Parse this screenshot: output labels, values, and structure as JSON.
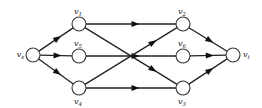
{
  "diagram": {
    "type": "directed-network",
    "nodes": [
      {
        "id": "vs",
        "base": "v",
        "sub": "s",
        "x": 33,
        "y": 55,
        "label_pos": "left"
      },
      {
        "id": "v1",
        "base": "v",
        "sub": "1",
        "x": 79,
        "y": 24,
        "label_pos": "above"
      },
      {
        "id": "v5",
        "base": "v",
        "sub": "5",
        "x": 79,
        "y": 56,
        "label_pos": "above"
      },
      {
        "id": "v4",
        "base": "v",
        "sub": "4",
        "x": 79,
        "y": 88,
        "label_pos": "below"
      },
      {
        "id": "v2",
        "base": "v",
        "sub": "2",
        "x": 183,
        "y": 24,
        "label_pos": "above"
      },
      {
        "id": "v6",
        "base": "v",
        "sub": "6",
        "x": 183,
        "y": 56,
        "label_pos": "above"
      },
      {
        "id": "v3",
        "base": "v",
        "sub": "3",
        "x": 183,
        "y": 88,
        "label_pos": "below"
      },
      {
        "id": "vt",
        "base": "v",
        "sub": "t",
        "x": 233,
        "y": 55,
        "label_pos": "right"
      }
    ],
    "edges": [
      {
        "from": "vs",
        "to": "v1"
      },
      {
        "from": "vs",
        "to": "v5"
      },
      {
        "from": "vs",
        "to": "v4"
      },
      {
        "from": "v1",
        "to": "v2"
      },
      {
        "from": "v1",
        "to": "v3"
      },
      {
        "from": "v5",
        "to": "v6"
      },
      {
        "from": "v4",
        "to": "v2"
      },
      {
        "from": "v4",
        "to": "v3"
      },
      {
        "from": "v2",
        "to": "vt"
      },
      {
        "from": "v6",
        "to": "vt"
      },
      {
        "from": "v3",
        "to": "vt"
      }
    ],
    "node_radius": 7,
    "colors": {
      "stroke": "#222222",
      "fill": "#ffffff"
    }
  }
}
